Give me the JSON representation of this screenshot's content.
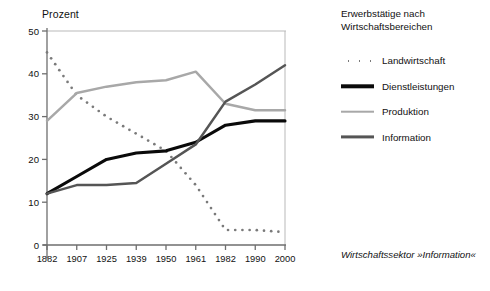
{
  "axis": {
    "ylabel": "Prozent",
    "yticks": [
      "0",
      "10",
      "20",
      "30",
      "40",
      "50"
    ],
    "xticks": [
      "1882",
      "1907",
      "1925",
      "1939",
      "1950",
      "1961",
      "1982",
      "1990",
      "2000"
    ]
  },
  "legend": {
    "title_line1": "Erwerbstätige nach",
    "title_line2": "Wirtschaftsbereichen",
    "entries": [
      {
        "label": "Landwirtschaft",
        "key": "dotted",
        "color": "#7a7a7a"
      },
      {
        "label": "Dienstleistungen",
        "key": "thick-black",
        "color": "#0a0a0a"
      },
      {
        "label": "Produktion",
        "key": "light-gray",
        "color": "#a8a8a8"
      },
      {
        "label": "Information",
        "key": "dark-gray",
        "color": "#555555"
      }
    ]
  },
  "caption": "Wirtschaftssektor »Information«",
  "chart_data": {
    "type": "line",
    "title": "Erwerbstätige nach Wirtschaftsbereichen",
    "xlabel": "",
    "ylabel": "Prozent",
    "ylim": [
      0,
      50
    ],
    "yticks": [
      0,
      10,
      20,
      30,
      40,
      50
    ],
    "grid": false,
    "legend_position": "right",
    "annotation": "Wirtschaftssektor »Information«",
    "categories": [
      "1882",
      "1907",
      "1925",
      "1939",
      "1950",
      "1961",
      "1982",
      "1990",
      "2000"
    ],
    "series": [
      {
        "name": "Landwirtschaft",
        "style": "dotted",
        "color": "#7a7a7a",
        "values": [
          45,
          35,
          30,
          26,
          22,
          14,
          3.5,
          3.5,
          3
        ]
      },
      {
        "name": "Dienstleistungen",
        "style": "solid-thick",
        "color": "#0a0a0a",
        "values": [
          12,
          16,
          20,
          21.5,
          22,
          24,
          28,
          29,
          29
        ]
      },
      {
        "name": "Produktion",
        "style": "solid",
        "color": "#a8a8a8",
        "values": [
          29,
          35.5,
          37,
          38,
          38.5,
          40.5,
          33,
          31.5,
          31.5
        ]
      },
      {
        "name": "Information",
        "style": "solid",
        "color": "#555555",
        "values": [
          12,
          14,
          14,
          14.5,
          19,
          23.5,
          33.5,
          37.5,
          42
        ]
      }
    ]
  }
}
